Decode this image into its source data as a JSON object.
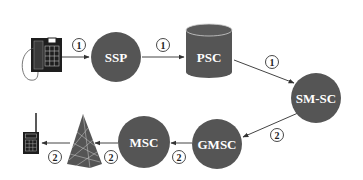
{
  "diagram": {
    "colors": {
      "node_fill": "#555555",
      "edge": "#333333",
      "background": "#ffffff",
      "node_text": "#ffffff"
    },
    "nodes": [
      {
        "id": "phone",
        "label": "",
        "type": "telephone-icon"
      },
      {
        "id": "ssp",
        "label": "SSP",
        "type": "circle"
      },
      {
        "id": "psc",
        "label": "PSC",
        "type": "cylinder"
      },
      {
        "id": "smsc",
        "label": "SM-SC",
        "type": "circle"
      },
      {
        "id": "gmsc",
        "label": "GMSC",
        "type": "circle"
      },
      {
        "id": "msc",
        "label": "MSC",
        "type": "circle"
      },
      {
        "id": "tower",
        "label": "",
        "type": "antenna-tower-icon"
      },
      {
        "id": "mobile",
        "label": "",
        "type": "mobile-phone-icon"
      }
    ],
    "edges": [
      {
        "from": "phone",
        "to": "ssp",
        "step": "1"
      },
      {
        "from": "ssp",
        "to": "psc",
        "step": "1"
      },
      {
        "from": "psc",
        "to": "smsc",
        "step": "1"
      },
      {
        "from": "smsc",
        "to": "gmsc",
        "step": "2"
      },
      {
        "from": "gmsc",
        "to": "msc",
        "step": "2"
      },
      {
        "from": "msc",
        "to": "tower",
        "step": "2"
      },
      {
        "from": "tower",
        "to": "mobile",
        "step": "2"
      }
    ]
  }
}
